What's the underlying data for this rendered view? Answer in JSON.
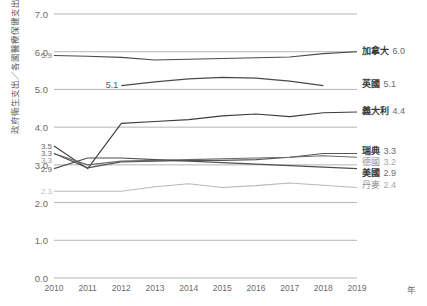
{
  "chart_data": {
    "type": "line",
    "title": "",
    "xlabel": "年",
    "ylabel": "政府衛生支出／各國醫療保健支出（%）",
    "ylim": [
      0.0,
      7.0
    ],
    "ytick_labels": [
      "0.0",
      "1.0",
      "2.0",
      "3.0",
      "4.0",
      "5.0",
      "6.0",
      "7.0"
    ],
    "ytick_values": [
      0.0,
      1.0,
      2.0,
      3.0,
      4.0,
      5.0,
      6.0,
      7.0
    ],
    "grid": true,
    "legend_position": "right",
    "x": [
      2010,
      2011,
      2012,
      2013,
      2014,
      2015,
      2016,
      2017,
      2018,
      2019
    ],
    "xtick_labels": [
      "2010",
      "2011",
      "2012",
      "2013",
      "2014",
      "2015",
      "2016",
      "2017",
      "2018",
      "2019"
    ],
    "series": [
      {
        "name": "加拿大",
        "end_value": "6.0",
        "color": "#4a4a4a",
        "start_label": "5.9",
        "x": [
          2010,
          2011,
          2012,
          2013,
          2014,
          2015,
          2016,
          2017,
          2018,
          2019
        ],
        "values": [
          5.9,
          5.88,
          5.85,
          5.78,
          5.8,
          5.82,
          5.84,
          5.86,
          5.95,
          6.0
        ]
      },
      {
        "name": "英國",
        "end_value": "5.1",
        "color": "#4a4a4a",
        "start_label": "5.1",
        "x": [
          2012,
          2013,
          2014,
          2015,
          2016,
          2017,
          2018
        ],
        "values": [
          5.1,
          5.2,
          5.28,
          5.32,
          5.3,
          5.22,
          5.1
        ]
      },
      {
        "name": "義大利",
        "end_value": "4.4",
        "color": "#3c3c3c",
        "start_label": "3.5",
        "x": [
          2010,
          2011,
          2012,
          2013,
          2014,
          2015,
          2016,
          2017,
          2018,
          2019
        ],
        "values": [
          3.5,
          2.9,
          4.1,
          4.15,
          4.2,
          4.3,
          4.35,
          4.28,
          4.38,
          4.4
        ]
      },
      {
        "name": "瑞典",
        "end_value": "3.3",
        "color": "#555555",
        "start_label": "3.3",
        "x": [
          2010,
          2011,
          2012,
          2013,
          2014,
          2015,
          2016,
          2017,
          2018,
          2019
        ],
        "values": [
          3.3,
          2.92,
          3.08,
          3.1,
          3.12,
          3.12,
          3.14,
          3.2,
          3.3,
          3.3
        ]
      },
      {
        "name": "德國",
        "end_value": "3.2",
        "color": "#6a6a6a",
        "start_label": "3.3",
        "x": [
          2010,
          2011,
          2012,
          2013,
          2014,
          2015,
          2016,
          2017,
          2018,
          2019
        ],
        "values": [
          3.3,
          3.0,
          3.1,
          3.12,
          3.14,
          3.16,
          3.18,
          3.2,
          3.24,
          3.2
        ]
      },
      {
        "name": "美國",
        "end_value": "2.9",
        "color": "#4f4f4f",
        "start_label": "2.9",
        "x": [
          2010,
          2011,
          2012,
          2013,
          2014,
          2015,
          2016,
          2017,
          2018,
          2019
        ],
        "values": [
          2.9,
          3.18,
          3.18,
          3.14,
          3.1,
          3.06,
          3.02,
          2.98,
          2.94,
          2.9
        ]
      },
      {
        "name": "丹麥",
        "end_value": "2.4",
        "color": "#b9b9b9",
        "start_label": "2.3",
        "x": [
          2010,
          2011,
          2012,
          2013,
          2014,
          2015,
          2016,
          2017,
          2018,
          2019
        ],
        "values": [
          2.3,
          2.3,
          2.3,
          2.42,
          2.5,
          2.4,
          2.45,
          2.52,
          2.46,
          2.4
        ]
      }
    ]
  },
  "legend": [
    {
      "name": "加拿大",
      "value": "6.0",
      "bold": true
    },
    {
      "name": "英國",
      "value": "5.1",
      "bold": true
    },
    {
      "name": "義大利",
      "value": "4.4",
      "bold": true
    },
    {
      "name": "瑞典",
      "value": "3.3",
      "bold": true
    },
    {
      "name": "德國",
      "value": "3.2",
      "bold": false
    },
    {
      "name": "美國",
      "value": "2.9",
      "bold": true
    },
    {
      "name": "丹麥",
      "value": "2.4",
      "bold": false
    }
  ],
  "start_labels": [
    {
      "text": "5.9",
      "value": 5.9
    },
    {
      "text": "3.5",
      "value": 3.5
    },
    {
      "text": "3.3",
      "value": 3.3
    },
    {
      "text": "3.3",
      "value": 3.3
    },
    {
      "text": "2.9",
      "value": 2.9
    },
    {
      "text": "2.3",
      "value": 2.3
    }
  ],
  "uk_inline_label": {
    "text": "5.1"
  }
}
